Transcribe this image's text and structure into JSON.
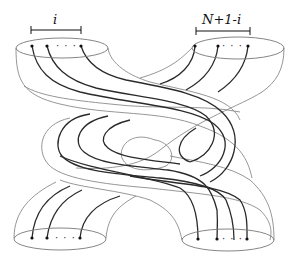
{
  "figure": {
    "type": "tube braid diagram",
    "labels": {
      "top_left_group": "i",
      "top_right_group": "N+1-i"
    },
    "ellipsis": "· · ·",
    "ports": [
      {
        "position": "top-left",
        "strand_count_label": "i"
      },
      {
        "position": "top-right",
        "strand_count_label": "N+1-i"
      },
      {
        "position": "bottom-left",
        "strand_count_label": ""
      },
      {
        "position": "bottom-right",
        "strand_count_label": ""
      }
    ],
    "colors": {
      "strand": "#2a2a2a",
      "tube_outline": "#8a8a8a",
      "background": "#ffffff"
    }
  }
}
